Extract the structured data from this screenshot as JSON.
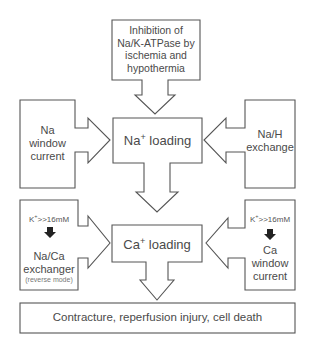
{
  "diagram": {
    "nodes": {
      "top": {
        "lines": [
          "Inhibition of",
          "Na/K-ATPase by",
          "ischemia and",
          "hypothermia"
        ]
      },
      "na_loading": {
        "base": "Na",
        "sup": "+",
        "rest": " loading"
      },
      "na_window": {
        "lines": [
          "Na",
          "window",
          "current"
        ]
      },
      "na_h": {
        "lines": [
          "Na/H",
          "exchange"
        ]
      },
      "na_ca": {
        "cond_base": "K",
        "cond_sup": "+",
        "cond_rest": ">>16mM",
        "lines": [
          "Na/Ca",
          "exchanger"
        ],
        "note": "(reverse mode)"
      },
      "ca_loading": {
        "base": "Ca",
        "sup": "+",
        "rest": " loading"
      },
      "ca_window": {
        "cond_base": "K",
        "cond_sup": "+",
        "cond_rest": ">>16mM",
        "lines": [
          "Ca",
          "window",
          "current"
        ]
      },
      "outcome": {
        "text": "Contracture, reperfusion injury, cell death"
      }
    },
    "colors": {
      "stroke": "#555555",
      "text": "#4a4a4a",
      "fill": "#ffffff",
      "marker": "#222222"
    }
  }
}
